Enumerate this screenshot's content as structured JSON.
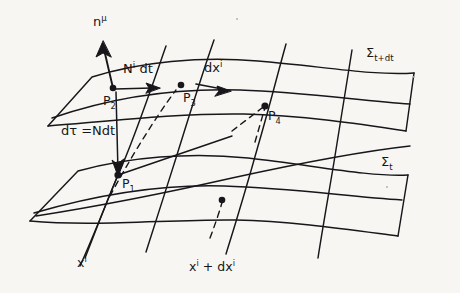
{
  "figure": {
    "kind": "spacetime-foliation-diagram",
    "background_color": "#f7f6f2",
    "ink_color": "#17161a"
  },
  "surfaces": [
    {
      "id": "sigma-t-dt",
      "label_sigma": "Σ",
      "label_subscript": "t+dt",
      "role": "upper-hypersurface"
    },
    {
      "id": "sigma-t",
      "label_sigma": "Σ",
      "label_subscript": "t",
      "role": "lower-hypersurface"
    }
  ],
  "points": [
    {
      "id": "p1",
      "base": "P",
      "index": "1",
      "x": 118,
      "y": 175
    },
    {
      "id": "p2",
      "base": "P",
      "index": "2",
      "x": 113,
      "y": 88
    },
    {
      "id": "p3",
      "base": "P",
      "index": "3",
      "x": 181,
      "y": 85
    },
    {
      "id": "p4",
      "base": "P",
      "index": "4",
      "x": 265,
      "y": 106
    },
    {
      "id": "p-lower-right",
      "base": "",
      "index": "",
      "x": 222,
      "y": 200
    }
  ],
  "vectors": [
    {
      "id": "normal",
      "base": "n",
      "superscript": "μ",
      "description": "unit normal to the hypersurface"
    },
    {
      "id": "shift",
      "base": "N",
      "superscript": "i",
      "suffix": " dt",
      "description": "shift vector displacement"
    },
    {
      "id": "coord-displacement",
      "base": "dx",
      "superscript": "i",
      "description": "coordinate displacement on the slice"
    }
  ],
  "annotations": {
    "proper_time": {
      "lead": "dτ",
      "equals": "=",
      "value": "Ndt",
      "description": "lapse times coordinate time"
    }
  },
  "coordinate_lines": [
    {
      "id": "x-i",
      "base": "x",
      "superscript": "i"
    },
    {
      "id": "x-i-plus-dx-i",
      "base": "x",
      "superscript": "i",
      "plus": "+ dx",
      "superscript2": "i"
    }
  ],
  "labels": {
    "n_mu": {
      "base": "n",
      "sup": "μ"
    },
    "N_i_dt": {
      "base": "N",
      "sup": "i",
      "tail": "dt"
    },
    "dx_i": {
      "base": "dx",
      "sup": "i"
    },
    "dtau": {
      "text": "dτ =Ndt"
    },
    "p1": {
      "base": "P",
      "sub": "1"
    },
    "p2": {
      "base": "P",
      "sub": "2"
    },
    "p3": {
      "base": "P",
      "sub": "3"
    },
    "p4": {
      "base": "P",
      "sub": "4"
    },
    "sigma_t_dt": {
      "base": "Σ",
      "sub": "t+dt"
    },
    "sigma_t": {
      "base": "Σ",
      "sub": "t"
    },
    "x_i": {
      "base": "x",
      "sup": "i"
    },
    "x_i_dx_i": {
      "base": "x",
      "sup": "i",
      "mid": "+ dx",
      "sup2": "i"
    }
  }
}
